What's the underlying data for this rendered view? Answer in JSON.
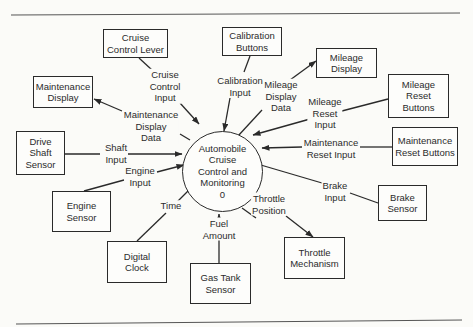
{
  "diagram": {
    "type": "context data flow diagram",
    "process": {
      "name": "Automobile\nCruise\nControl and\nMonitoring\n0",
      "number": "0"
    },
    "entities": [
      {
        "id": "cruise-control-lever",
        "label": "Cruise\nControl Lever"
      },
      {
        "id": "calibration-buttons",
        "label": "Calibration\nButtons"
      },
      {
        "id": "mileage-display",
        "label": "Mileage\nDisplay"
      },
      {
        "id": "maintenance-display",
        "label": "Maintenance\nDisplay"
      },
      {
        "id": "mileage-reset-buttons",
        "label": "Mileage\nReset\nButtons"
      },
      {
        "id": "drive-shaft-sensor",
        "label": "Drive\nShaft\nSensor"
      },
      {
        "id": "maintenance-reset-buttons",
        "label": "Maintenance\nReset Buttons"
      },
      {
        "id": "engine-sensor",
        "label": "Engine\nSensor"
      },
      {
        "id": "brake-sensor",
        "label": "Brake\nSensor"
      },
      {
        "id": "digital-clock",
        "label": "Digital\nClock"
      },
      {
        "id": "throttle-mechanism",
        "label": "Throttle\nMechanism"
      },
      {
        "id": "gas-tank-sensor",
        "label": "Gas Tank\nSensor"
      }
    ],
    "flows": [
      {
        "id": "cruise-control-input",
        "label": "Cruise\nControl\nInput",
        "from": "Cruise Control Lever",
        "to": "process"
      },
      {
        "id": "calibration-input",
        "label": "Calibration\nInput",
        "from": "Calibration Buttons",
        "to": "process"
      },
      {
        "id": "mileage-display-data",
        "label": "Mileage\nDisplay\nData",
        "from": "process",
        "to": "Mileage Display"
      },
      {
        "id": "maintenance-display-data",
        "label": "Maintenance\nDisplay\nData",
        "from": "process",
        "to": "Maintenance Display"
      },
      {
        "id": "mileage-reset-input",
        "label": "Mileage\nReset\nInput",
        "from": "Mileage Reset Buttons",
        "to": "process"
      },
      {
        "id": "shaft-input",
        "label": "Shaft\nInput",
        "from": "Drive Shaft Sensor",
        "to": "process"
      },
      {
        "id": "maintenance-reset-input",
        "label": "Maintenance\nReset Input",
        "from": "Maintenance Reset Buttons",
        "to": "process"
      },
      {
        "id": "engine-input",
        "label": "Engine\nInput",
        "from": "Engine Sensor",
        "to": "process"
      },
      {
        "id": "brake-input",
        "label": "Brake\nInput",
        "from": "Brake Sensor",
        "to": "process"
      },
      {
        "id": "time",
        "label": "Time",
        "from": "Digital Clock",
        "to": "process"
      },
      {
        "id": "fuel-amount",
        "label": "Fuel\nAmount",
        "from": "Gas Tank Sensor",
        "to": "process"
      },
      {
        "id": "throttle-position",
        "label": "Throttle\nPosition",
        "from": "process",
        "to": "Throttle Mechanism"
      }
    ]
  },
  "colors": {
    "ink": "#2a2a2a",
    "paper": "#fbfbf8"
  }
}
